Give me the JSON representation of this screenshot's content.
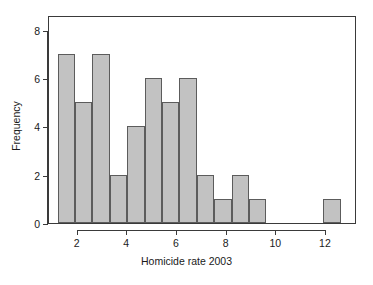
{
  "chart_data": {
    "type": "bar",
    "title": "",
    "subtitle": "",
    "xlabel": "Homicide rate 2003",
    "ylabel": "Frequency",
    "xlim": [
      0.85,
      13.25
    ],
    "ylim": [
      0,
      8.6
    ],
    "grid": false,
    "legend": null,
    "bin_width": 0.7,
    "xticks": [
      2,
      4,
      6,
      8,
      10,
      12
    ],
    "xtick_labels": [
      "2",
      "4",
      "6",
      "8",
      "10",
      "12"
    ],
    "yticks": [
      0,
      2,
      4,
      6,
      8
    ],
    "ytick_labels": [
      "0",
      "2",
      "4",
      "6",
      "8"
    ],
    "bin_starts": [
      1.2,
      1.9,
      2.6,
      3.3,
      4.0,
      4.7,
      5.4,
      6.1,
      6.8,
      7.5,
      8.2,
      8.9,
      11.9
    ],
    "bin_ends": [
      1.9,
      2.6,
      3.3,
      4.0,
      4.7,
      5.4,
      6.1,
      6.8,
      7.5,
      8.2,
      8.9,
      9.6,
      12.6
    ],
    "categories": [
      "1.2-1.9",
      "1.9-2.6",
      "2.6-3.3",
      "3.3-4.0",
      "4.0-4.7",
      "4.7-5.4",
      "5.4-6.1",
      "6.1-6.8",
      "6.8-7.5",
      "7.5-8.2",
      "8.2-8.9",
      "8.9-9.6",
      "11.9-12.6"
    ],
    "values": [
      7,
      5,
      7,
      2,
      4,
      6,
      5,
      6,
      2,
      1,
      2,
      1,
      1
    ],
    "bar_fill_color": "#c2c2c2",
    "bar_edge_color": "#5c5c5c",
    "axis_color": "#3a3a3a",
    "background_color": "#ffffff"
  }
}
